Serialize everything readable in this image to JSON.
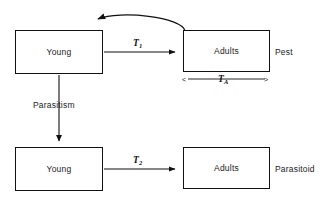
{
  "diagram": {
    "type": "host-parasitoid-life-cycle-flow-diagram",
    "nodes": [
      {
        "id": "pest-young",
        "label": "Young"
      },
      {
        "id": "pest-adults",
        "label": "Adults"
      },
      {
        "id": "parasitoid-young",
        "label": "Young"
      },
      {
        "id": "parasitoid-adults",
        "label": "Adults"
      }
    ],
    "group_labels": {
      "pest": "Pest",
      "parasitoid": "Parasitoid"
    },
    "edges": [
      {
        "id": "pest-development",
        "from": "pest-young",
        "to": "pest-adults",
        "symbol": "T",
        "subscript": "1",
        "style": "straight-arrow-right"
      },
      {
        "id": "pest-reproduction-feedback",
        "from": "pest-adults",
        "to": "pest-young",
        "style": "curved-arrow-left"
      },
      {
        "id": "parasitism",
        "from": "pest-young",
        "to": "parasitoid-young",
        "label": "Parasitism",
        "style": "straight-arrow-down"
      },
      {
        "id": "parasitoid-development",
        "from": "parasitoid-young",
        "to": "parasitoid-adults",
        "symbol": "T",
        "subscript": "2",
        "style": "straight-arrow-right"
      }
    ],
    "span_annotation": {
      "id": "adult-lifespan",
      "symbol": "T",
      "subscript": "A",
      "left_marker": "<",
      "right_marker": ">"
    },
    "colors": {
      "stroke": "#111111",
      "text": "#1a1a1a",
      "background": "#ffffff"
    }
  }
}
